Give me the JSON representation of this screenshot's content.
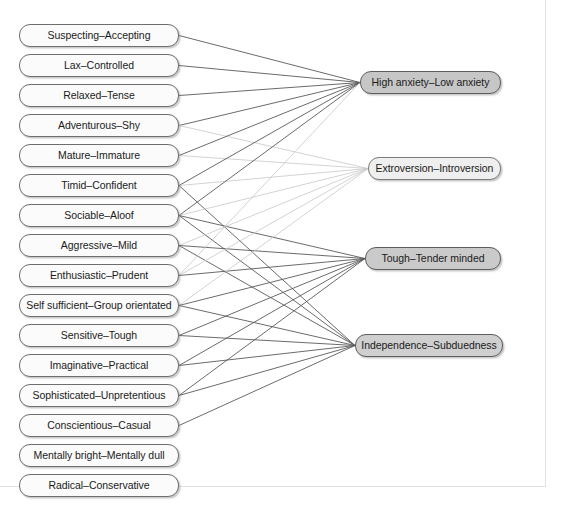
{
  "figure": {
    "type": "bipartite-node-link-diagram"
  },
  "chart_data": {
    "type": "diagram",
    "title": "",
    "layout": "bipartite left-to-right",
    "left_nodes": [
      {
        "id": "L1",
        "label": "Suspecting–Accepting",
        "x": 19,
        "y": 24,
        "w": 160
      },
      {
        "id": "L2",
        "label": "Lax–Controlled",
        "x": 19,
        "y": 54,
        "w": 160
      },
      {
        "id": "L3",
        "label": "Relaxed–Tense",
        "x": 19,
        "y": 84,
        "w": 160
      },
      {
        "id": "L4",
        "label": "Adventurous–Shy",
        "x": 19,
        "y": 114,
        "w": 160
      },
      {
        "id": "L5",
        "label": "Mature–Immature",
        "x": 19,
        "y": 144,
        "w": 160
      },
      {
        "id": "L6",
        "label": "Timid–Confident",
        "x": 19,
        "y": 174,
        "w": 160
      },
      {
        "id": "L7",
        "label": "Sociable–Aloof",
        "x": 19,
        "y": 204,
        "w": 160
      },
      {
        "id": "L8",
        "label": "Aggressive–Mild",
        "x": 19,
        "y": 234,
        "w": 160
      },
      {
        "id": "L9",
        "label": "Enthusiastic–Prudent",
        "x": 19,
        "y": 264,
        "w": 160
      },
      {
        "id": "L10",
        "label": "Self sufficient–Group orientated",
        "x": 19,
        "y": 294,
        "w": 160
      },
      {
        "id": "L11",
        "label": "Sensitive–Tough",
        "x": 19,
        "y": 324,
        "w": 160
      },
      {
        "id": "L12",
        "label": "Imaginative–Practical",
        "x": 19,
        "y": 354,
        "w": 160
      },
      {
        "id": "L13",
        "label": "Sophisticated–Unpretentious",
        "x": 19,
        "y": 384,
        "w": 160
      },
      {
        "id": "L14",
        "label": "Conscientious–Casual",
        "x": 19,
        "y": 414,
        "w": 160
      },
      {
        "id": "L15",
        "label": "Mentally bright–Mentally dull",
        "x": 19,
        "y": 444,
        "w": 160
      },
      {
        "id": "L16",
        "label": "Radical–Conservative",
        "x": 19,
        "y": 474,
        "w": 160
      }
    ],
    "right_nodes": [
      {
        "id": "R1",
        "label": "High anxiety–Low anxiety",
        "x": 360,
        "y": 71,
        "w": 141,
        "shade": "shade-dark"
      },
      {
        "id": "R2",
        "label": "Extroversion–Introversion",
        "x": 368,
        "y": 157,
        "w": 133,
        "shade": "shade-light"
      },
      {
        "id": "R3",
        "label": "Tough–Tender minded",
        "x": 365,
        "y": 247,
        "w": 136,
        "shade": "shade-medium"
      },
      {
        "id": "R4",
        "label": "Independence–Subduedness",
        "x": 355,
        "y": 334,
        "w": 148,
        "shade": "shade-mid"
      }
    ],
    "edges": [
      {
        "from": "L1",
        "to": "R1",
        "weight": "strong"
      },
      {
        "from": "L2",
        "to": "R1",
        "weight": "strong"
      },
      {
        "from": "L3",
        "to": "R1",
        "weight": "strong"
      },
      {
        "from": "L4",
        "to": "R1",
        "weight": "strong"
      },
      {
        "from": "L4",
        "to": "R2",
        "weight": "weak"
      },
      {
        "from": "L5",
        "to": "R1",
        "weight": "strong"
      },
      {
        "from": "L5",
        "to": "R2",
        "weight": "weak"
      },
      {
        "from": "L6",
        "to": "R1",
        "weight": "strong"
      },
      {
        "from": "L6",
        "to": "R2",
        "weight": "weak"
      },
      {
        "from": "L6",
        "to": "R4",
        "weight": "strong"
      },
      {
        "from": "L7",
        "to": "R1",
        "weight": "strong"
      },
      {
        "from": "L7",
        "to": "R2",
        "weight": "weak"
      },
      {
        "from": "L7",
        "to": "R3",
        "weight": "strong"
      },
      {
        "from": "L7",
        "to": "R4",
        "weight": "strong"
      },
      {
        "from": "L8",
        "to": "R2",
        "weight": "weak"
      },
      {
        "from": "L8",
        "to": "R3",
        "weight": "strong"
      },
      {
        "from": "L8",
        "to": "R4",
        "weight": "strong"
      },
      {
        "from": "L9",
        "to": "R1",
        "weight": "weak"
      },
      {
        "from": "L9",
        "to": "R2",
        "weight": "weak"
      },
      {
        "from": "L9",
        "to": "R3",
        "weight": "strong"
      },
      {
        "from": "L10",
        "to": "R2",
        "weight": "weak"
      },
      {
        "from": "L10",
        "to": "R3",
        "weight": "strong"
      },
      {
        "from": "L10",
        "to": "R4",
        "weight": "strong"
      },
      {
        "from": "L11",
        "to": "R3",
        "weight": "strong"
      },
      {
        "from": "L11",
        "to": "R4",
        "weight": "strong"
      },
      {
        "from": "L12",
        "to": "R3",
        "weight": "strong"
      },
      {
        "from": "L12",
        "to": "R4",
        "weight": "strong"
      },
      {
        "from": "L13",
        "to": "R3",
        "weight": "strong"
      },
      {
        "from": "L13",
        "to": "R4",
        "weight": "strong"
      },
      {
        "from": "L14",
        "to": "R4",
        "weight": "strong"
      }
    ],
    "colors": {
      "edge_strong": "#5a5a5a",
      "edge_weak": "#c8c8c8",
      "node_left_fill": "#fbfbfb",
      "node_left_border": "#6e6e6e",
      "node_right_dark": "#c6c6c6",
      "node_right_light": "#efefef",
      "background": "#ffffff",
      "frame": "#e3e3e3"
    }
  }
}
